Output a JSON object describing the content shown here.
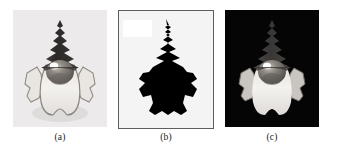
{
  "figure": {
    "type": "image-segmentation-figure",
    "panel_count": 3,
    "background_color": "#ffffff"
  },
  "panels": [
    {
      "id": "a",
      "caption": "(a)",
      "role": "original-grayscale-image",
      "subject": "garden gnome statue",
      "background_color": "#eceaea",
      "has_border": false,
      "description": "Original grayscale photograph of a garden gnome with a tall dark pointed hat, shaded face and a light beard and robe on a light gray background."
    },
    {
      "id": "b",
      "caption": "(b)",
      "role": "binary-segmentation-mask",
      "subject": "garden gnome silhouette",
      "background_color": "#f4f4f4",
      "mask_color": "#000000",
      "border_color": "#5d5d5d",
      "has_border": true,
      "artifact": "bright white rectangle at upper left",
      "description": "Binary mask: the gnome region rendered solid black on a near-white background, enclosed in a thin gray rectangular frame."
    },
    {
      "id": "c",
      "caption": "(c)",
      "role": "extracted-object-on-black",
      "subject": "garden gnome statue",
      "background_color": "#050505",
      "has_border": false,
      "description": "Segmented result: the gnome's original gray levels preserved while everything outside the mask is set to black."
    }
  ],
  "captions": {
    "a": "(a)",
    "b": "(b)",
    "c": "(c)"
  },
  "colors": {
    "page_background": "#ffffff",
    "panel_a_background": "#eceaea",
    "panel_b_background": "#f4f4f4",
    "panel_b_border": "#5d5d5d",
    "panel_c_background": "#050505",
    "hat_dark": "#2b2b2b",
    "hat_mid": "#3c3c3c",
    "face_gray": "#7b7671",
    "body_light": "#f1efec",
    "highlight": "#ffffff",
    "caption_text": "#1a1a1a"
  }
}
